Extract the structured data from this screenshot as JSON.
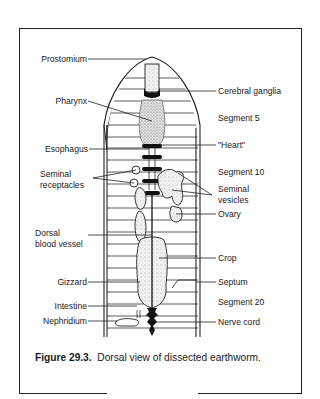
{
  "figure": {
    "number": "Figure 29.3.",
    "title": "Dorsal view of dissected earthworm."
  },
  "labels_left": [
    {
      "id": "prostomium",
      "text": "Prostomium"
    },
    {
      "id": "pharynx",
      "text": "Pharynx"
    },
    {
      "id": "esophagus",
      "text": "Esophagus"
    },
    {
      "id": "seminal_receptacles_1",
      "text": "Seminal"
    },
    {
      "id": "seminal_receptacles_2",
      "text": "receptacles"
    },
    {
      "id": "dorsal_blood_vessel_1",
      "text": "Dorsal"
    },
    {
      "id": "dorsal_blood_vessel_2",
      "text": "blood vessel"
    },
    {
      "id": "gizzard",
      "text": "Gizzard"
    },
    {
      "id": "intestine",
      "text": "Intestine"
    },
    {
      "id": "nephridium",
      "text": "Nephridium"
    }
  ],
  "labels_right": [
    {
      "id": "cerebral_ganglia",
      "text": "Cerebral ganglia"
    },
    {
      "id": "segment_5",
      "text": "Segment 5"
    },
    {
      "id": "heart",
      "text": "\"Heart\""
    },
    {
      "id": "segment_10",
      "text": "Segment 10"
    },
    {
      "id": "seminal_vesicles_1",
      "text": "Seminal"
    },
    {
      "id": "seminal_vesicles_2",
      "text": "vesicles"
    },
    {
      "id": "ovary",
      "text": "Ovary"
    },
    {
      "id": "crop",
      "text": "Crop"
    },
    {
      "id": "septum",
      "text": "Septum"
    },
    {
      "id": "segment_20",
      "text": "Segment 20"
    },
    {
      "id": "nerve_cord",
      "text": "Nerve cord"
    }
  ]
}
